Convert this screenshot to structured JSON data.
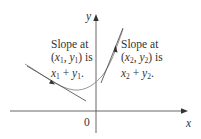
{
  "diagram": {
    "axes": {
      "x_label": "x",
      "y_label": "y",
      "origin_label": "0"
    },
    "annotations": [
      {
        "id": "point1",
        "line1": "Slope at",
        "line2_open": "(",
        "line2_x": "x",
        "line2_xsub": "1",
        "line2_comma": ", ",
        "line2_y": "y",
        "line2_ysub": "1",
        "line2_close": ") is",
        "line3_x": "x",
        "line3_xsub": "1",
        "line3_plus": " + ",
        "line3_y": "y",
        "line3_ysub": "1",
        "line3_end": "."
      },
      {
        "id": "point2",
        "line1": "Slope at",
        "line2_open": "(",
        "line2_x": "x",
        "line2_xsub": "2",
        "line2_comma": ", ",
        "line2_y": "y",
        "line2_ysub": "2",
        "line2_close": ") is",
        "line3_x": "x",
        "line3_xsub": "2",
        "line3_plus": " + ",
        "line3_y": "y",
        "line3_ysub": "2",
        "line3_end": "."
      }
    ],
    "colors": {
      "axis": "#555555",
      "curve": "#8a8a8a",
      "tangent": "#555555",
      "text": "#333333"
    }
  }
}
